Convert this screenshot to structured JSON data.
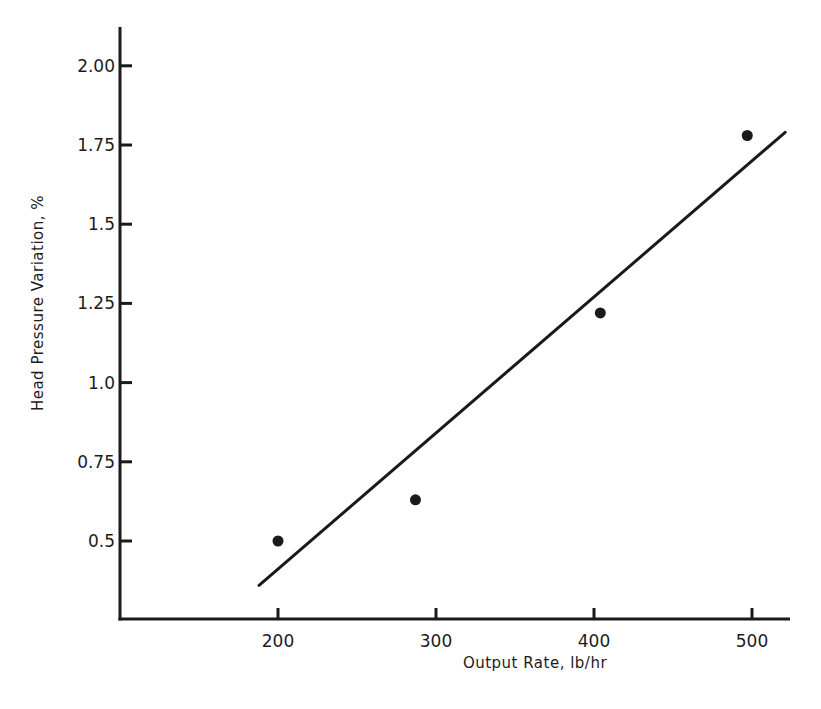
{
  "chart_data": {
    "type": "scatter",
    "title": "",
    "xlabel": "Output Rate, lb/hr",
    "ylabel": "Head Pressure Variation, %",
    "xlim": [
      110,
      525
    ],
    "ylim": [
      0.25,
      2.15
    ],
    "grid": false,
    "legend": null,
    "x_ticks": [
      200,
      300,
      400,
      500
    ],
    "x_tick_labels": [
      "200",
      "300",
      "400",
      "500"
    ],
    "y_ticks": [
      0.5,
      0.75,
      1.0,
      1.25,
      1.5,
      1.75,
      2.0
    ],
    "y_tick_labels": [
      "0.5",
      "0.75",
      "1.0",
      "1.25",
      "1.5",
      "1.75",
      "2.00"
    ],
    "series": [
      {
        "name": "measured",
        "type": "scatter",
        "marker": "filled-circle",
        "color": "#1a1a1a",
        "points": [
          {
            "x": 200,
            "y": 0.5
          },
          {
            "x": 287,
            "y": 0.63
          },
          {
            "x": 404,
            "y": 1.22
          },
          {
            "x": 497,
            "y": 1.78
          }
        ]
      },
      {
        "name": "fit line",
        "type": "line",
        "color": "#1a1a1a",
        "points": [
          {
            "x": 188,
            "y": 0.36
          },
          {
            "x": 521,
            "y": 1.79
          }
        ]
      }
    ]
  }
}
